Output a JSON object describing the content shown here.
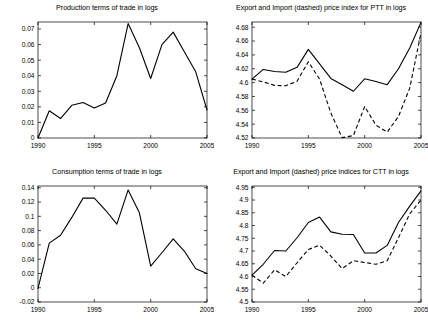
{
  "figure": {
    "background": "#ffffff",
    "line_color": "#000000",
    "panel_count": 4
  },
  "chart_data": [
    {
      "type": "line",
      "panel": "top-left",
      "title": "Production terms of trade in logs",
      "xlabel": "",
      "ylabel": "",
      "x": [
        1990,
        1991,
        1992,
        1993,
        1994,
        1995,
        1996,
        1997,
        1998,
        1999,
        2000,
        2001,
        2002,
        2003,
        2004,
        2005
      ],
      "xlim": [
        1990,
        2005
      ],
      "ylim": [
        0,
        0.0745
      ],
      "xticks": [
        1990,
        1995,
        2000,
        2005
      ],
      "xtick_labels": [
        "1990",
        "1995",
        "2000",
        "2005"
      ],
      "yticks": [
        0,
        0.01,
        0.02,
        0.03,
        0.04,
        0.05,
        0.06,
        0.07
      ],
      "ytick_labels": [
        "0",
        "0.01",
        "0.02",
        "0.03",
        "0.04",
        "0.05",
        "0.06",
        "0.07"
      ],
      "grid": false,
      "legend": null,
      "series": [
        {
          "name": "Production terms of trade",
          "style": "solid",
          "values": [
            0.0,
            0.0175,
            0.0125,
            0.021,
            0.0228,
            0.0192,
            0.0225,
            0.04,
            0.0735,
            0.058,
            0.0382,
            0.06,
            0.068,
            0.0552,
            0.0425,
            0.018
          ]
        }
      ]
    },
    {
      "type": "line",
      "panel": "top-right",
      "title": "Export and Import (dashed) price index for PTT in logs",
      "xlabel": "",
      "ylabel": "",
      "x": [
        1990,
        1991,
        1992,
        1993,
        1994,
        1995,
        1996,
        1997,
        1998,
        1999,
        2000,
        2001,
        2002,
        2003,
        2004,
        2005
      ],
      "xlim": [
        1990,
        2005
      ],
      "ylim": [
        4.52,
        4.6875
      ],
      "xticks": [
        1990,
        1995,
        2000,
        2005
      ],
      "xtick_labels": [
        "1990",
        "1995",
        "2000",
        "2005"
      ],
      "yticks": [
        4.52,
        4.54,
        4.56,
        4.58,
        4.6,
        4.62,
        4.64,
        4.66,
        4.68
      ],
      "ytick_labels": [
        "4.52",
        "4.54",
        "4.56",
        "4.58",
        "4.6",
        "4.62",
        "4.64",
        "4.66",
        "4.68"
      ],
      "grid": false,
      "legend": "Export = solid, Import = dashed",
      "series": [
        {
          "name": "Export price index (PTT)",
          "style": "solid",
          "values": [
            4.605,
            4.619,
            4.616,
            4.615,
            4.622,
            4.648,
            4.627,
            4.606,
            4.597,
            4.5875,
            4.6055,
            4.6015,
            4.597,
            4.62,
            4.65,
            4.687
          ]
        },
        {
          "name": "Import price index (PTT)",
          "style": "dashed",
          "values": [
            4.605,
            4.601,
            4.596,
            4.5955,
            4.602,
            4.63,
            4.605,
            4.556,
            4.5205,
            4.5235,
            4.5655,
            4.5385,
            4.5285,
            4.551,
            4.592,
            4.672
          ]
        }
      ]
    },
    {
      "type": "line",
      "panel": "bottom-left",
      "title": "Consumption terms of trade in logs",
      "xlabel": "",
      "ylabel": "",
      "x": [
        1990,
        1991,
        1992,
        1993,
        1994,
        1995,
        1996,
        1997,
        1998,
        1999,
        2000,
        2001,
        2002,
        2003,
        2004,
        2005
      ],
      "xlim": [
        1990,
        2005
      ],
      "ylim": [
        -0.02,
        0.1425
      ],
      "xticks": [
        1990,
        1995,
        2000,
        2005
      ],
      "xtick_labels": [
        "1990",
        "1995",
        "2000",
        "2005"
      ],
      "yticks": [
        -0.02,
        0,
        0.02,
        0.04,
        0.06,
        0.08,
        0.1,
        0.12,
        0.14
      ],
      "ytick_labels": [
        "-0.02",
        "0",
        "0.02",
        "0.04",
        "0.06",
        "0.08",
        "0.1",
        "0.12",
        "0.14"
      ],
      "grid": false,
      "legend": null,
      "series": [
        {
          "name": "Consumption terms of trade",
          "style": "solid",
          "values": [
            -0.001,
            0.0625,
            0.0735,
            0.0985,
            0.1255,
            0.1255,
            0.1085,
            0.089,
            0.137,
            0.105,
            0.0302,
            0.049,
            0.0685,
            0.051,
            0.0265,
            0.02
          ]
        }
      ]
    },
    {
      "type": "line",
      "panel": "bottom-right",
      "title": "Export and Import (dashed) price indices for CTT in logs",
      "xlabel": "",
      "ylabel": "",
      "x": [
        1990,
        1991,
        1992,
        1993,
        1994,
        1995,
        1996,
        1997,
        1998,
        1999,
        2000,
        2001,
        2002,
        2003,
        2004,
        2005
      ],
      "xlim": [
        1990,
        2005
      ],
      "ylim": [
        4.5,
        4.955
      ],
      "xticks": [
        1990,
        1995,
        2000,
        2005
      ],
      "xtick_labels": [
        "1990",
        "1995",
        "2000",
        "2005"
      ],
      "yticks": [
        4.5,
        4.55,
        4.6,
        4.65,
        4.7,
        4.75,
        4.8,
        4.85,
        4.9,
        4.95
      ],
      "ytick_labels": [
        "4.5",
        "4.55",
        "4.6",
        "4.65",
        "4.7",
        "4.75",
        "4.8",
        "4.85",
        "4.9",
        "4.95"
      ],
      "grid": false,
      "legend": "Export = solid, Import = dashed",
      "series": [
        {
          "name": "Export price index (CTT)",
          "style": "solid",
          "values": [
            4.605,
            4.648,
            4.702,
            4.7,
            4.752,
            4.812,
            4.833,
            4.775,
            4.766,
            4.765,
            4.692,
            4.692,
            4.722,
            4.812,
            4.876,
            4.936
          ]
        },
        {
          "name": "Import price index (CTT)",
          "style": "dashed",
          "values": [
            4.605,
            4.574,
            4.626,
            4.6,
            4.654,
            4.706,
            4.723,
            4.68,
            4.631,
            4.662,
            4.655,
            4.648,
            4.662,
            4.752,
            4.846,
            4.9
          ]
        }
      ]
    }
  ]
}
